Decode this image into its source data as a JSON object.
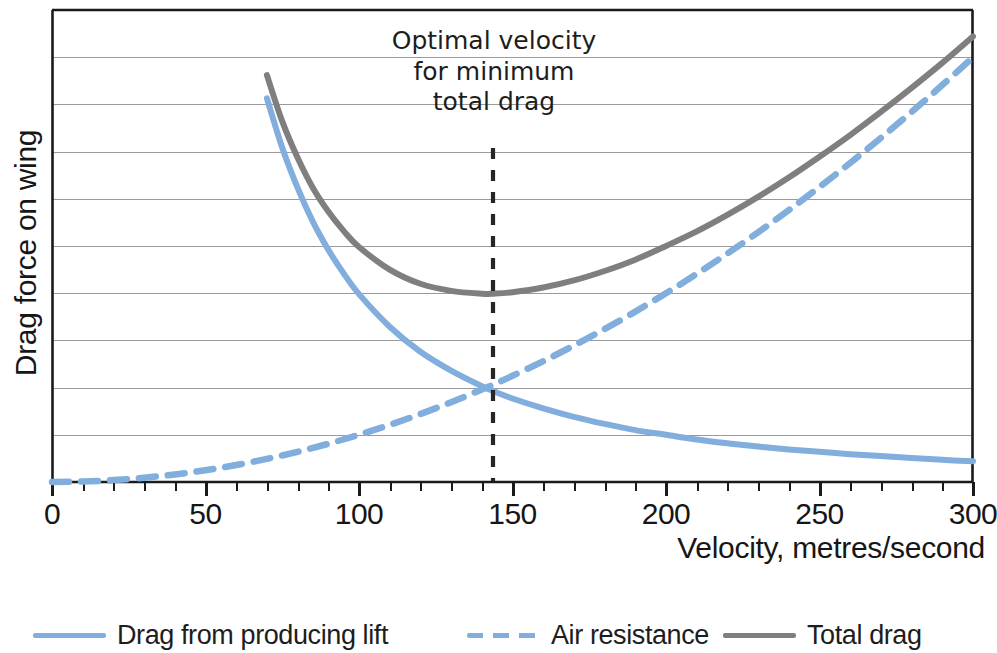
{
  "chart_data": {
    "type": "line",
    "title": "",
    "xlabel": "Velocity, metres/second",
    "ylabel": "Drag force on wing",
    "xlim": [
      0,
      300
    ],
    "ylim": [
      0,
      10
    ],
    "grid": true,
    "grid_axis": "y",
    "y_ticks_labelled": false,
    "legend_position": "bottom",
    "xticks": [
      "0",
      "50",
      "100",
      "150",
      "200",
      "250",
      "300"
    ],
    "xtick_values": [
      0,
      50,
      100,
      150,
      200,
      250,
      300
    ],
    "x_minor_tick_interval": 10,
    "gridline_count": 9,
    "annotations": [
      {
        "text_lines": [
          "Optimal velocity",
          "for minimum",
          "total drag"
        ],
        "marker": "vertical-dashed-line",
        "x_value": 144,
        "label": "Optimal velocity for minimum total drag"
      }
    ],
    "series": [
      {
        "name": "Drag from producing lift",
        "style": "solid",
        "color": "#81AEDC",
        "x": [
          70,
          75,
          80,
          85,
          90,
          95,
          100,
          110,
          120,
          130,
          140,
          144,
          150,
          160,
          170,
          180,
          190,
          200,
          210,
          220,
          230,
          240,
          250,
          260,
          270,
          280,
          290,
          300
        ],
        "y": [
          8.13,
          7.08,
          6.23,
          5.51,
          4.92,
          4.42,
          3.98,
          3.29,
          2.76,
          2.36,
          2.03,
          1.92,
          1.77,
          1.56,
          1.38,
          1.23,
          1.1,
          1.0,
          0.9,
          0.82,
          0.75,
          0.69,
          0.64,
          0.59,
          0.55,
          0.51,
          0.47,
          0.44
        ]
      },
      {
        "name": "Air resistance",
        "style": "dashed",
        "color": "#81AEDC",
        "x": [
          0,
          10,
          20,
          30,
          40,
          50,
          60,
          70,
          80,
          90,
          100,
          110,
          120,
          130,
          140,
          144,
          150,
          160,
          170,
          180,
          190,
          200,
          210,
          220,
          230,
          240,
          250,
          260,
          270,
          280,
          290,
          300
        ],
        "y": [
          0.0,
          0.01,
          0.04,
          0.09,
          0.16,
          0.25,
          0.36,
          0.49,
          0.64,
          0.81,
          1.0,
          1.21,
          1.44,
          1.69,
          1.96,
          2.07,
          2.25,
          2.56,
          2.89,
          3.24,
          3.61,
          4.0,
          4.41,
          4.84,
          5.29,
          5.76,
          6.25,
          6.76,
          7.29,
          7.84,
          8.41,
          9.0
        ]
      },
      {
        "name": "Total drag",
        "style": "solid",
        "color": "#7F7F7F",
        "x": [
          70,
          75,
          80,
          85,
          90,
          95,
          100,
          110,
          120,
          130,
          140,
          144,
          150,
          160,
          170,
          180,
          190,
          200,
          210,
          220,
          230,
          240,
          250,
          260,
          270,
          280,
          290,
          300
        ],
        "y": [
          8.62,
          7.64,
          6.87,
          6.23,
          5.73,
          5.32,
          4.98,
          4.5,
          4.2,
          4.05,
          3.99,
          3.99,
          4.02,
          4.12,
          4.27,
          4.47,
          4.71,
          5.0,
          5.31,
          5.66,
          6.04,
          6.45,
          6.89,
          7.35,
          7.84,
          8.35,
          8.88,
          9.44
        ]
      }
    ]
  },
  "axis": {
    "ylabel": "Drag force on wing",
    "xlabel": "Velocity, metres/second",
    "xticks": [
      "0",
      "50",
      "100",
      "150",
      "200",
      "250",
      "300"
    ]
  },
  "annotation": {
    "line1": "Optimal velocity",
    "line2": "for minimum",
    "line3": "total drag"
  },
  "legend": {
    "items": [
      {
        "label": "Drag from producing lift",
        "style": "solid",
        "color": "#81AEDC"
      },
      {
        "label": "Air resistance",
        "style": "dashed",
        "color": "#81AEDC"
      },
      {
        "label": "Total drag",
        "style": "solid",
        "color": "#7F7F7F"
      }
    ]
  },
  "colors": {
    "blue": "#81AEDC",
    "gray": "#7F7F7F",
    "axis": "#1a1a1a",
    "grid": "#9a9a9a",
    "annotation_line": "#262626"
  }
}
